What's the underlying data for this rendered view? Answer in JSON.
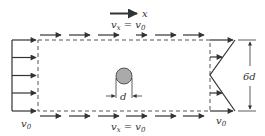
{
  "diagram": {
    "axis_label": "x",
    "top_label": {
      "v": "v",
      "sub": "x",
      "eq": " = ",
      "v0": "v",
      "sub0": "0"
    },
    "bottom_label": {
      "v": "v",
      "sub": "x",
      "eq": " = ",
      "v0": "v",
      "sub0": "0"
    },
    "inlet_label": {
      "v": "v",
      "sub": "0"
    },
    "outlet_label": {
      "v": "v",
      "sub": "0"
    },
    "cylinder_label": "d",
    "height_label": "6d",
    "colors": {
      "line": "#333333",
      "cylinder_fill": "#aaaaaa",
      "dash": "#555555"
    }
  }
}
